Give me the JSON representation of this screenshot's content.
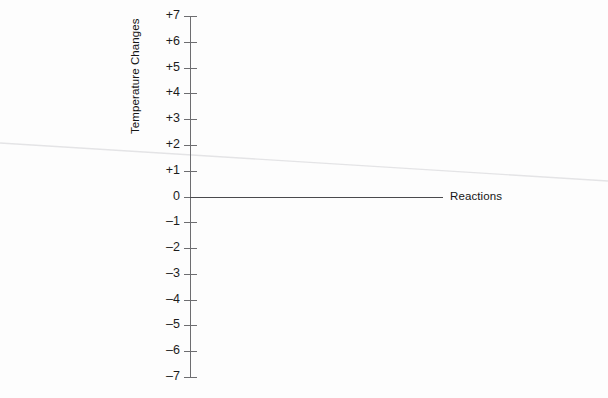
{
  "chart_data": {
    "type": "line",
    "title": "",
    "subtitle": "",
    "xlabel": "Reactions",
    "ylabel": "Temperature Changes",
    "ylim": [
      -7,
      7
    ],
    "ytick_labels": [
      "+7",
      "+6",
      "+5",
      "+4",
      "+3",
      "+2",
      "+1",
      "0",
      "–1",
      "–2",
      "–3",
      "–4",
      "–5",
      "–6",
      "–7"
    ],
    "ytick_values": [
      7,
      6,
      5,
      4,
      3,
      2,
      1,
      0,
      -1,
      -2,
      -3,
      -4,
      -5,
      -6,
      -7
    ],
    "grid": false,
    "legend": "none",
    "x_axis_visible": false,
    "series": [
      {
        "name": "Reactions",
        "label": "Reactions",
        "label_position": "right-of-line",
        "x": [
          0,
          1
        ],
        "values": [
          0,
          0
        ],
        "color": "#4a4a4d"
      }
    ],
    "annotations": []
  },
  "axis": {
    "y_title": "Temperature Changes",
    "tick_color": "#6d6d70",
    "line_color": "#6d6d70"
  },
  "series_label": {
    "text": "Reactions",
    "color": "#161616"
  },
  "artifacts": {
    "caption_remnant": "",
    "scan_rule_color": "#e4e4e6"
  },
  "colors": {
    "background": "#fdfdfd",
    "axis": "#6d6d70",
    "baseline": "#4a4a4d",
    "text": "#1a1a1a",
    "faint": "#e4e4e6"
  }
}
